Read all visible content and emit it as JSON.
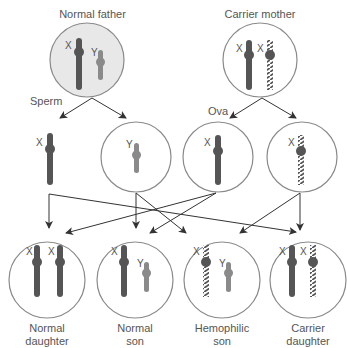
{
  "parents": {
    "father": {
      "label": "Normal father",
      "chromosomes": [
        "X",
        "Y"
      ],
      "fill": "#e8e8e8"
    },
    "mother": {
      "label": "Carrier mother",
      "chromosomes": [
        "X",
        "X"
      ]
    }
  },
  "gametes": {
    "sperm_label": "Sperm",
    "ova_label": "Ova",
    "sperm": [
      {
        "chromosome": "X"
      },
      {
        "chromosome": "Y"
      }
    ],
    "ova": [
      {
        "chromosome": "X",
        "type": "normal"
      },
      {
        "chromosome": "X",
        "type": "hemophilia"
      }
    ]
  },
  "offspring": [
    {
      "label_line1": "Normal",
      "label_line2": "daughter",
      "chromosomes": [
        "X",
        "X"
      ]
    },
    {
      "label_line1": "Normal",
      "label_line2": "son",
      "chromosomes": [
        "X",
        "Y"
      ]
    },
    {
      "label_line1": "Hemophilic",
      "label_line2": "son",
      "chromosomes": [
        "X",
        "Y"
      ]
    },
    {
      "label_line1": "Carrier",
      "label_line2": "daughter",
      "chromosomes": [
        "X",
        "X"
      ]
    }
  ],
  "colors": {
    "x_chromosome": "#555555",
    "y_chromosome": "#8a8a8a",
    "hemophilia_stripe": "#555555",
    "circle_stroke": "#8a8a8a",
    "arrow": "#333333"
  }
}
